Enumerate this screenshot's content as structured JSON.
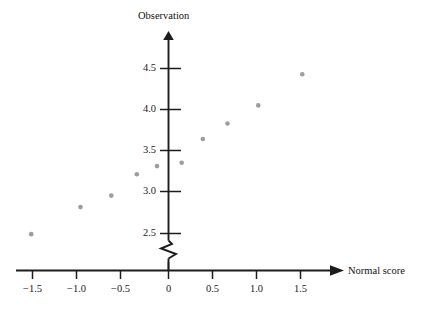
{
  "chart_data": {
    "type": "scatter",
    "title": "",
    "xlabel": "Normal score",
    "ylabel": "Observation",
    "grid": false,
    "legend": "none",
    "xlim": [
      -1.75,
      1.75
    ],
    "ylim": [
      2.35,
      4.65
    ],
    "y_axis_break": true,
    "x_ticks": [
      {
        "value": -1.5,
        "label": "−1.5"
      },
      {
        "value": -1.0,
        "label": "−1.0"
      },
      {
        "value": -0.5,
        "label": "−0.5"
      },
      {
        "value": 0,
        "label": "0"
      },
      {
        "value": 0.5,
        "label": "0.5"
      },
      {
        "value": 1.0,
        "label": "1.0"
      },
      {
        "value": 1.5,
        "label": "1.5"
      }
    ],
    "y_ticks": [
      {
        "value": 4.5,
        "label": "4.5"
      },
      {
        "value": 4.0,
        "label": "4.0"
      },
      {
        "value": 3.5,
        "label": "3.5"
      },
      {
        "value": 3.0,
        "label": "3.0"
      },
      {
        "value": 2.5,
        "label": "2.5"
      }
    ],
    "x": [
      -1.56,
      -1.0,
      -0.65,
      -0.36,
      -0.13,
      0.15,
      0.39,
      0.67,
      1.02,
      1.52
    ],
    "y": [
      2.48,
      2.81,
      2.95,
      3.21,
      3.31,
      3.35,
      3.64,
      3.83,
      4.05,
      4.43
    ],
    "points": [
      {
        "x": -1.56,
        "y": 2.48
      },
      {
        "x": -1.0,
        "y": 2.81
      },
      {
        "x": -0.65,
        "y": 2.95
      },
      {
        "x": -0.36,
        "y": 3.21
      },
      {
        "x": -0.13,
        "y": 3.31
      },
      {
        "x": 0.15,
        "y": 3.35
      },
      {
        "x": 0.39,
        "y": 3.64
      },
      {
        "x": 0.67,
        "y": 3.83
      },
      {
        "x": 1.02,
        "y": 4.05
      },
      {
        "x": 1.52,
        "y": 4.43
      }
    ],
    "marker_color": "#9d9d9d",
    "axis_color": "#1c1c1c"
  }
}
